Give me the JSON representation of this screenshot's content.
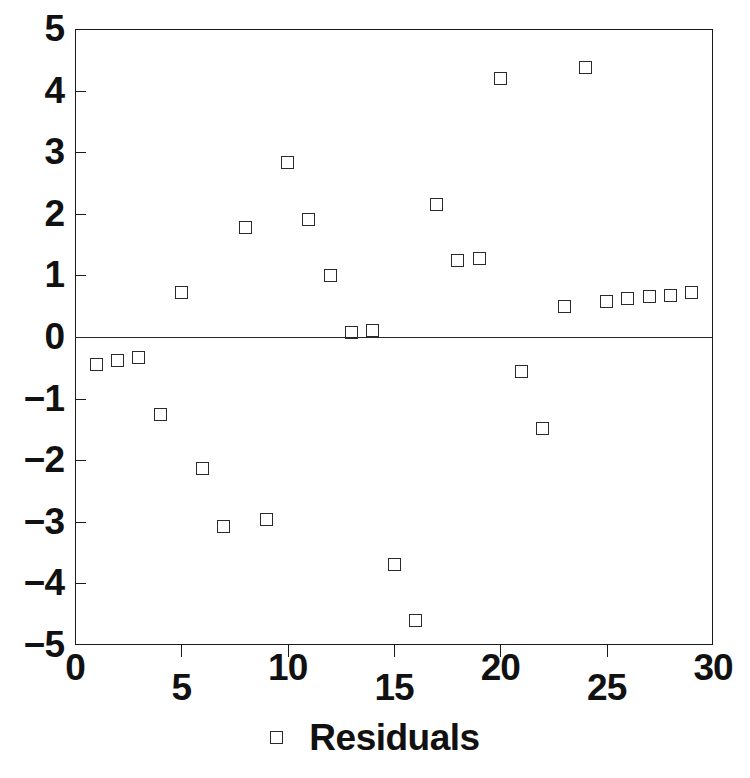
{
  "chart_data": {
    "type": "scatter",
    "title": "",
    "subtitle": "",
    "xlabel": "",
    "ylabel": "",
    "xlim": [
      0,
      30
    ],
    "ylim": [
      -5,
      5
    ],
    "grid": false,
    "zero_line": true,
    "legend_position": "bottom-center",
    "marker_style": "open-square",
    "xticks": [
      0,
      5,
      10,
      15,
      20,
      25,
      30
    ],
    "xtick_labels": [
      "0",
      "5",
      "10",
      "15",
      "20",
      "25",
      "30"
    ],
    "yticks": [
      5,
      4,
      3,
      2,
      1,
      0,
      -1,
      -2,
      -3,
      -4,
      -5
    ],
    "ytick_labels": [
      "5",
      "4",
      "3",
      "2",
      "1",
      "0",
      "−1",
      "−2",
      "−3",
      "−4",
      "−5"
    ],
    "series": [
      {
        "name": "Residuals",
        "marker": "open-square",
        "color": "#2b2b2b",
        "x": [
          1,
          2,
          3,
          4,
          5,
          6,
          7,
          8,
          9,
          10,
          11,
          12,
          13,
          14,
          15,
          16,
          17,
          18,
          19,
          20,
          21,
          22,
          23,
          24,
          25,
          26,
          27,
          28,
          29
        ],
        "y": [
          -0.45,
          -0.38,
          -0.33,
          -1.25,
          0.72,
          -2.13,
          -3.07,
          1.78,
          -2.97,
          2.83,
          1.9,
          1.0,
          0.07,
          0.1,
          -3.7,
          -4.6,
          2.15,
          1.25,
          1.28,
          4.2,
          -0.56,
          -1.49,
          0.5,
          4.37,
          0.58,
          0.62,
          0.65,
          0.68,
          0.73
        ]
      }
    ]
  },
  "legend": {
    "label": "Residuals"
  },
  "axes": {
    "x_ticks": [
      {
        "value": 0,
        "label": "0"
      },
      {
        "value": 5,
        "label": "5"
      },
      {
        "value": 10,
        "label": "10"
      },
      {
        "value": 15,
        "label": "15"
      },
      {
        "value": 20,
        "label": "20"
      },
      {
        "value": 25,
        "label": "25"
      },
      {
        "value": 30,
        "label": "30"
      }
    ],
    "y_ticks": [
      {
        "value": 5,
        "label": "5"
      },
      {
        "value": 4,
        "label": "4"
      },
      {
        "value": 3,
        "label": "3"
      },
      {
        "value": 2,
        "label": "2"
      },
      {
        "value": 1,
        "label": "1"
      },
      {
        "value": 0,
        "label": "0"
      },
      {
        "value": -1,
        "label": "−1"
      },
      {
        "value": -2,
        "label": "−2"
      },
      {
        "value": -3,
        "label": "−3"
      },
      {
        "value": -4,
        "label": "−4"
      },
      {
        "value": -5,
        "label": "−5"
      }
    ]
  }
}
